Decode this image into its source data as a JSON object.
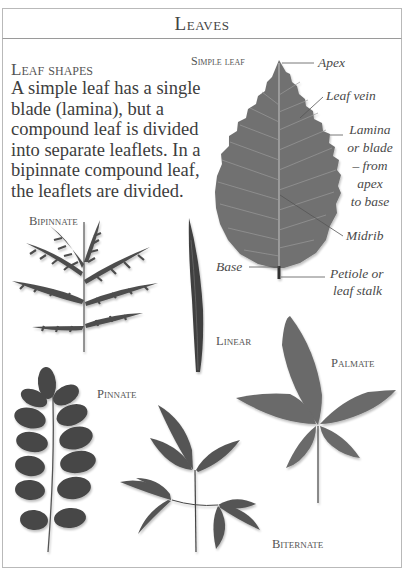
{
  "header": {
    "title": "Leaves"
  },
  "intro": {
    "subheading": "Leaf shapes",
    "body": "A simple leaf has a single blade (lamina), but a compound leaf is divided into separate leaflets. In a bipinnate compound leaf, the leaflets are divided."
  },
  "simple_leaf": {
    "label": "Simple leaf",
    "parts": {
      "apex": "Apex",
      "leaf_vein": "Leaf vein",
      "lamina_line1": "Lamina",
      "lamina_line2": "or blade",
      "lamina_line3": "– from",
      "lamina_line4": "apex",
      "lamina_line5": "to base",
      "midrib": "Midrib",
      "base": "Base",
      "petiole_line1": "Petiole or",
      "petiole_line2": "leaf stalk"
    }
  },
  "shapes": {
    "bipinnate": "Bipinnate",
    "linear": "Linear",
    "palmate": "Palmate",
    "pinnate": "Pinnate",
    "biternate": "Biternate"
  },
  "colors": {
    "frame": "#b9b9b9",
    "leaf_fill": "#6e6e6e",
    "leaf_dark": "#4a4a4a",
    "text": "#444444"
  }
}
